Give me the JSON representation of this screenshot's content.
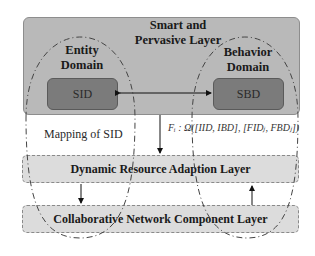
{
  "diagram": {
    "top_layer": {
      "title_line1": "Smart and",
      "title_line2": "Pervasive Layer"
    },
    "entity_domain": {
      "line1": "Entity",
      "line2": "Domain",
      "box_label": "SID"
    },
    "behavior_domain": {
      "line1": "Behavior",
      "line2": "Domain",
      "box_label": "SBD"
    },
    "mapping_label": "Mapping of SID",
    "formula": "Fᵢ : Ω([IID, IBD], [FIDⱼ, FBDⱼ])",
    "middle_layer": "Dynamic Resource Adaption Layer",
    "bottom_layer": "Collaborative Network Component Layer",
    "colors": {
      "top_layer_fill": "#b9b9b9",
      "inner_box_fill": "#7b7b7b",
      "dashed_layer_fill": "#dcdcdc",
      "arrow": "#111111"
    }
  }
}
